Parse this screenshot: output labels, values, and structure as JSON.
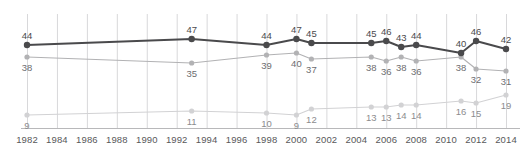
{
  "chart_data": {
    "type": "line",
    "title": "",
    "subtitle": "",
    "xlabel": "",
    "ylabel": "",
    "grid": true,
    "grid_axis": "x",
    "legend": "none",
    "xlim": [
      1982,
      2014
    ],
    "ylim": [
      0,
      55
    ],
    "axis_ticks": [
      "1982",
      "1984",
      "1986",
      "1988",
      "1990",
      "1992",
      "1994",
      "1996",
      "1998",
      "2000",
      "2002",
      "2004",
      "2006",
      "2008",
      "2010",
      "2012",
      "2014"
    ],
    "x": [
      1982,
      1993,
      1998,
      2000,
      2001,
      2005,
      2006,
      2007,
      2008,
      2011,
      2012,
      2014
    ],
    "series": [
      {
        "name": "series-dark",
        "color": "#4a4a4c",
        "values": [
          44,
          47,
          44,
          47,
          45,
          45,
          46,
          43,
          44,
          40,
          46,
          42
        ],
        "labels": [
          "44",
          "47",
          "44",
          "47",
          "45",
          "45",
          "46",
          "43",
          "44",
          "40",
          "46",
          "42"
        ]
      },
      {
        "name": "series-mid",
        "color": "#b2b2b4",
        "values": [
          38,
          35,
          39,
          40,
          37,
          38,
          36,
          38,
          36,
          38,
          32,
          31
        ],
        "labels": [
          "38",
          "35",
          "39",
          "40",
          "37",
          "38",
          "36",
          "38",
          "36",
          "38",
          "32",
          "31"
        ]
      },
      {
        "name": "series-light",
        "color": "#d2d2d4",
        "values": [
          9,
          11,
          10,
          9,
          12,
          13,
          13,
          14,
          14,
          16,
          15,
          19
        ],
        "labels": [
          "9",
          "11",
          "10",
          "9",
          "12",
          "13",
          "13",
          "14",
          "14",
          "16",
          "15",
          "19"
        ]
      }
    ]
  },
  "colors": {
    "series_dark": "#4a4a4c",
    "series_mid": "#b2b2b4",
    "series_light": "#d2d2d4",
    "gridline": "#d8d8da",
    "axis": "#b8b8ba",
    "tick_text": "#58585a"
  }
}
